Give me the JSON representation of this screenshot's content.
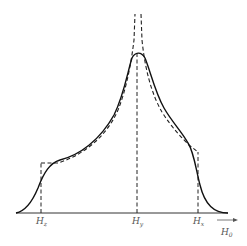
{
  "figure": {
    "type": "resonance-line-shape-diagram",
    "colors": {
      "ink": "#1a1a1a",
      "background": "#ffffff",
      "label": "#555555"
    },
    "axis": {
      "label_main": "H",
      "label_sub": "0",
      "has_arrow": true
    },
    "markers": [
      {
        "id": "hz",
        "main": "H",
        "sub": "z"
      },
      {
        "id": "hy",
        "main": "H",
        "sub": "y"
      },
      {
        "id": "hx",
        "main": "H",
        "sub": "x"
      }
    ],
    "curves": [
      {
        "name": "broadened absorption line",
        "style": "solid"
      },
      {
        "name": "unbroadened powder pattern",
        "style": "dashed"
      }
    ]
  }
}
